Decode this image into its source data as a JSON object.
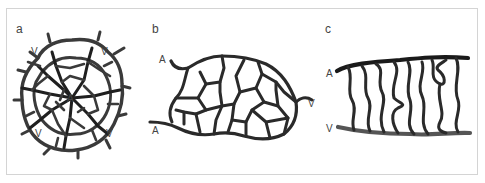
{
  "figure": {
    "panels": [
      {
        "id": "a",
        "label": "a",
        "description": "Radial capillary network with central artery and peripheral veins",
        "nodes": {
          "center": "A",
          "v_top_left": "V",
          "v_top_right": "V",
          "v_bottom_left": "V",
          "v_bottom_right": "V"
        }
      },
      {
        "id": "b",
        "label": "b",
        "description": "Irregular mesh capillary network between two arteries and one vein",
        "nodes": {
          "a_top": "A",
          "a_bottom": "A",
          "v_right": "V"
        }
      },
      {
        "id": "c",
        "label": "c",
        "description": "Parallel looping capillaries connecting artery (top) and vein (bottom)",
        "nodes": {
          "a_top": "A",
          "v_bottom": "V"
        }
      }
    ],
    "colors": {
      "frame_border": "#d4d4d4",
      "vessel_dark": "#1f1f1f",
      "vessel_mid": "#3a3a3a",
      "vein_gray": "#555555",
      "label_text": "#444444"
    }
  }
}
